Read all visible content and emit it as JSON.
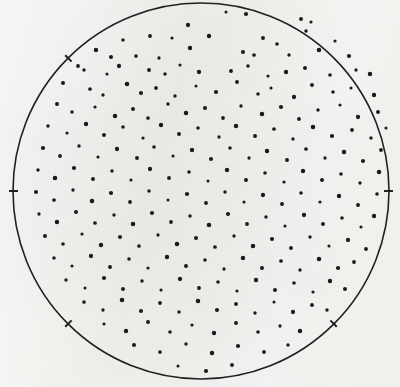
{
  "figure": {
    "medium": "halftone print scan",
    "background_color": "#fbfbfa",
    "ink_color": "#1a1a1a"
  },
  "chart_data": {
    "type": "scatter",
    "title": "",
    "subtitle": "",
    "xlabel": "",
    "ylabel": "",
    "grid": false,
    "legend": false,
    "legend_position": "none",
    "axes_visible": false,
    "xlim": [
      0,
      400
    ],
    "ylim": [
      387,
      0
    ],
    "units": "pixels",
    "point_count": 232,
    "point_color": "#1a1a1a",
    "point_radius": 1.85,
    "marker": "filled-circle",
    "boundary": {
      "shape": "circle",
      "center_x": 201,
      "center_y": 191,
      "radius": 188,
      "stroke_color": "#202020",
      "stroke_width": 1.6,
      "fill": "none"
    },
    "ticks": [
      {
        "name": "left-tick",
        "x": 14,
        "y": 156,
        "angle_deg": 180
      },
      {
        "name": "right-tick",
        "x": 388,
        "y": 172,
        "angle_deg": 0
      },
      {
        "name": "upper-left-tick",
        "x": 58,
        "y": 72,
        "angle_deg": 225
      },
      {
        "name": "lower-right-tick",
        "x": 362,
        "y": 268,
        "angle_deg": 45
      },
      {
        "name": "lower-left-tick",
        "x": 72,
        "y": 292,
        "angle_deg": 135
      }
    ],
    "points": [
      [
        226,
        12
      ],
      [
        246,
        14
      ],
      [
        301,
        19
      ],
      [
        306,
        31
      ],
      [
        311,
        22
      ],
      [
        188,
        25
      ],
      [
        150,
        36
      ],
      [
        123,
        40
      ],
      [
        172,
        38
      ],
      [
        209,
        36
      ],
      [
        263,
        38
      ],
      [
        277,
        44
      ],
      [
        335,
        41
      ],
      [
        96,
        50
      ],
      [
        111,
        57
      ],
      [
        136,
        56
      ],
      [
        159,
        58
      ],
      [
        190,
        48
      ],
      [
        243,
        52
      ],
      [
        254,
        55
      ],
      [
        289,
        55
      ],
      [
        319,
        50
      ],
      [
        349,
        56
      ],
      [
        78,
        66
      ],
      [
        84,
        70
      ],
      [
        107,
        74
      ],
      [
        119,
        66
      ],
      [
        149,
        70
      ],
      [
        165,
        74
      ],
      [
        180,
        65
      ],
      [
        199,
        72
      ],
      [
        231,
        71
      ],
      [
        248,
        66
      ],
      [
        268,
        76
      ],
      [
        286,
        72
      ],
      [
        305,
        68
      ],
      [
        330,
        75
      ],
      [
        356,
        70
      ],
      [
        370,
        74
      ],
      [
        63,
        83
      ],
      [
        90,
        89
      ],
      [
        103,
        95
      ],
      [
        127,
        84
      ],
      [
        141,
        93
      ],
      [
        156,
        88
      ],
      [
        175,
        96
      ],
      [
        196,
        86
      ],
      [
        216,
        92
      ],
      [
        237,
        82
      ],
      [
        258,
        94
      ],
      [
        271,
        88
      ],
      [
        294,
        97
      ],
      [
        312,
        85
      ],
      [
        333,
        92
      ],
      [
        351,
        88
      ],
      [
        374,
        95
      ],
      [
        57,
        104
      ],
      [
        72,
        112
      ],
      [
        95,
        107
      ],
      [
        115,
        116
      ],
      [
        133,
        109
      ],
      [
        148,
        118
      ],
      [
        168,
        104
      ],
      [
        186,
        113
      ],
      [
        205,
        108
      ],
      [
        223,
        118
      ],
      [
        241,
        106
      ],
      [
        262,
        114
      ],
      [
        281,
        107
      ],
      [
        299,
        119
      ],
      [
        318,
        110
      ],
      [
        340,
        105
      ],
      [
        358,
        117
      ],
      [
        378,
        112
      ],
      [
        48,
        126
      ],
      [
        67,
        133
      ],
      [
        86,
        124
      ],
      [
        104,
        135
      ],
      [
        123,
        127
      ],
      [
        143,
        138
      ],
      [
        161,
        125
      ],
      [
        179,
        134
      ],
      [
        198,
        128
      ],
      [
        219,
        137
      ],
      [
        236,
        126
      ],
      [
        255,
        136
      ],
      [
        274,
        129
      ],
      [
        293,
        139
      ],
      [
        313,
        127
      ],
      [
        332,
        136
      ],
      [
        352,
        130
      ],
      [
        371,
        138
      ],
      [
        386,
        128
      ],
      [
        43,
        148
      ],
      [
        60,
        156
      ],
      [
        79,
        146
      ],
      [
        98,
        157
      ],
      [
        117,
        149
      ],
      [
        137,
        158
      ],
      [
        154,
        147
      ],
      [
        173,
        156
      ],
      [
        192,
        150
      ],
      [
        211,
        159
      ],
      [
        230,
        148
      ],
      [
        249,
        158
      ],
      [
        267,
        151
      ],
      [
        287,
        160
      ],
      [
        306,
        149
      ],
      [
        325,
        158
      ],
      [
        344,
        152
      ],
      [
        363,
        161
      ],
      [
        381,
        150
      ],
      [
        38,
        170
      ],
      [
        55,
        178
      ],
      [
        74,
        168
      ],
      [
        93,
        179
      ],
      [
        112,
        171
      ],
      [
        131,
        180
      ],
      [
        150,
        169
      ],
      [
        169,
        178
      ],
      [
        189,
        172
      ],
      [
        208,
        181
      ],
      [
        227,
        170
      ],
      [
        246,
        180
      ],
      [
        265,
        173
      ],
      [
        284,
        182
      ],
      [
        303,
        171
      ],
      [
        322,
        180
      ],
      [
        341,
        174
      ],
      [
        360,
        183
      ],
      [
        379,
        172
      ],
      [
        36,
        192
      ],
      [
        54,
        200
      ],
      [
        73,
        190
      ],
      [
        92,
        201
      ],
      [
        111,
        193
      ],
      [
        130,
        202
      ],
      [
        149,
        191
      ],
      [
        168,
        200
      ],
      [
        187,
        194
      ],
      [
        206,
        203
      ],
      [
        225,
        192
      ],
      [
        244,
        202
      ],
      [
        263,
        195
      ],
      [
        282,
        204
      ],
      [
        301,
        193
      ],
      [
        320,
        202
      ],
      [
        339,
        196
      ],
      [
        358,
        205
      ],
      [
        377,
        194
      ],
      [
        39,
        214
      ],
      [
        57,
        222
      ],
      [
        76,
        212
      ],
      [
        95,
        223
      ],
      [
        114,
        215
      ],
      [
        133,
        224
      ],
      [
        152,
        213
      ],
      [
        171,
        222
      ],
      [
        190,
        216
      ],
      [
        209,
        225
      ],
      [
        228,
        214
      ],
      [
        247,
        224
      ],
      [
        266,
        217
      ],
      [
        285,
        226
      ],
      [
        304,
        215
      ],
      [
        323,
        224
      ],
      [
        342,
        218
      ],
      [
        361,
        227
      ],
      [
        374,
        216
      ],
      [
        45,
        236
      ],
      [
        63,
        244
      ],
      [
        82,
        234
      ],
      [
        101,
        245
      ],
      [
        120,
        237
      ],
      [
        139,
        246
      ],
      [
        158,
        235
      ],
      [
        177,
        244
      ],
      [
        196,
        238
      ],
      [
        215,
        247
      ],
      [
        234,
        236
      ],
      [
        253,
        246
      ],
      [
        272,
        239
      ],
      [
        291,
        248
      ],
      [
        310,
        237
      ],
      [
        329,
        246
      ],
      [
        348,
        240
      ],
      [
        366,
        249
      ],
      [
        54,
        258
      ],
      [
        72,
        266
      ],
      [
        91,
        256
      ],
      [
        110,
        267
      ],
      [
        129,
        259
      ],
      [
        148,
        268
      ],
      [
        167,
        257
      ],
      [
        186,
        266
      ],
      [
        205,
        260
      ],
      [
        224,
        269
      ],
      [
        243,
        258
      ],
      [
        262,
        268
      ],
      [
        281,
        261
      ],
      [
        300,
        270
      ],
      [
        319,
        259
      ],
      [
        338,
        268
      ],
      [
        354,
        262
      ],
      [
        66,
        280
      ],
      [
        85,
        288
      ],
      [
        104,
        278
      ],
      [
        123,
        289
      ],
      [
        142,
        281
      ],
      [
        161,
        290
      ],
      [
        180,
        279
      ],
      [
        199,
        288
      ],
      [
        218,
        282
      ],
      [
        237,
        291
      ],
      [
        256,
        280
      ],
      [
        275,
        290
      ],
      [
        294,
        283
      ],
      [
        313,
        292
      ],
      [
        330,
        281
      ],
      [
        345,
        289
      ],
      [
        84,
        302
      ],
      [
        103,
        310
      ],
      [
        122,
        300
      ],
      [
        141,
        311
      ],
      [
        160,
        303
      ],
      [
        179,
        312
      ],
      [
        198,
        301
      ],
      [
        217,
        310
      ],
      [
        236,
        304
      ],
      [
        255,
        313
      ],
      [
        274,
        302
      ],
      [
        293,
        312
      ],
      [
        312,
        305
      ],
      [
        327,
        310
      ],
      [
        104,
        324
      ],
      [
        126,
        331
      ],
      [
        148,
        322
      ],
      [
        170,
        332
      ],
      [
        192,
        325
      ],
      [
        214,
        333
      ],
      [
        236,
        323
      ],
      [
        258,
        332
      ],
      [
        280,
        326
      ],
      [
        300,
        331
      ],
      [
        134,
        345
      ],
      [
        160,
        352
      ],
      [
        186,
        344
      ],
      [
        212,
        353
      ],
      [
        238,
        346
      ],
      [
        264,
        352
      ],
      [
        288,
        345
      ],
      [
        178,
        366
      ],
      [
        206,
        371
      ],
      [
        232,
        365
      ]
    ]
  }
}
